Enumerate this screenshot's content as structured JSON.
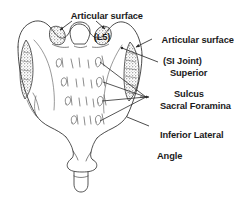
{
  "figure": {
    "background_color": "#ffffff",
    "ink_color": "#2b2b2b",
    "text_color": "#1b1b1b",
    "width_px": 234,
    "height_px": 199
  },
  "labels": {
    "articular_surface_l5": {
      "line1": "Articular surface",
      "line2": "(L5)"
    },
    "articular_surface_si": {
      "line1": "Articular surface",
      "line2": "(SI Joint)"
    },
    "superior_sulcus": {
      "line1": "Superior",
      "line2": "Sulcus"
    },
    "sacral_foramina": {
      "line1": "Sacral Foramina"
    },
    "inferior_lateral_angle": {
      "line1": "Inferior Lateral",
      "line2": "Angle"
    }
  },
  "anatomy": {
    "structures": [
      "sacrum-outline",
      "superior-articular-facets",
      "auricular-surface-left",
      "auricular-surface-right",
      "sacral-foramina-rows",
      "inferior-lateral-angle-left",
      "inferior-lateral-angle-right",
      "coccyx-segment",
      "median-sacral-crest"
    ],
    "foramina_row_count": 4,
    "foramina_per_row": 2,
    "view": "posterior"
  },
  "leaders": {
    "l5_arrow_count": 2,
    "si_joint_arrow_count": 1,
    "superior_sulcus_arrow_count": 1,
    "foramina_arrow_count": 4,
    "ila_arrow_count": 1
  }
}
